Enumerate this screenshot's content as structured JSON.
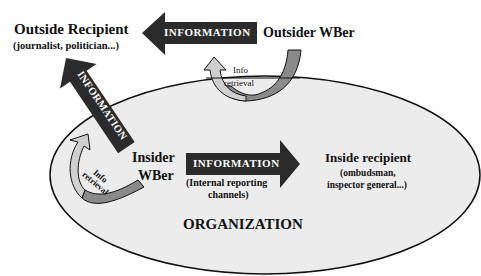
{
  "diagram": {
    "outside_recipient": {
      "title": "Outside Recipient",
      "subtitle": "(journalist, politician...)"
    },
    "outsider_wber": {
      "title": "Outsider WBer"
    },
    "insider_wber": {
      "line1": "Insider",
      "line2": "WBer"
    },
    "inside_recipient": {
      "title": "Inside recipient",
      "subtitle_line1": "(ombudsman,",
      "subtitle_line2": "inspector general...)"
    },
    "organization": {
      "label": "ORGANIZATION"
    },
    "arrows": {
      "top_information": "INFORMATION",
      "diagonal_information": "INFORMATION",
      "internal_information": "INFORMATION",
      "internal_caption_line1": "(Internal reporting",
      "internal_caption_line2": "channels)",
      "outsider_retrieval_line1": "Info",
      "outsider_retrieval_line2": "retrieval",
      "insider_retrieval_line1": "Info",
      "insider_retrieval_line2": "retrieval"
    },
    "colors": {
      "ellipse_fill": "#ececec",
      "arrow_dark": "#2b2b2b",
      "arrow_light": "#cfcfcf",
      "arrow_mid": "#8a8a8a"
    }
  }
}
